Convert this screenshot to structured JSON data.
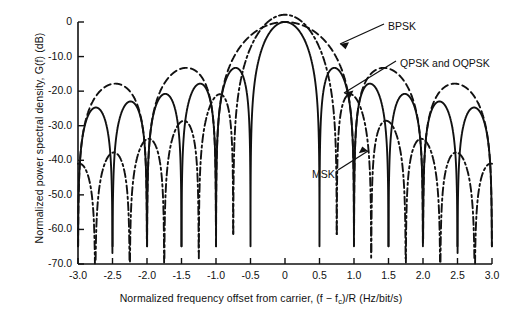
{
  "chart_data": {
    "type": "line",
    "title": "",
    "xlabel": "Normalized frequency offset from carrier, (f − f_c)/R (Hz/bit/s)",
    "xlabel_main": "Normalized frequency offset from carrier, (f − f",
    "xlabel_sub": "c",
    "xlabel_tail": ")/R (Hz/bit/s)",
    "ylabel": "Normalized power spectral density, G(f) (dB)",
    "xlim": [
      -3.0,
      3.0
    ],
    "ylim": [
      -70.0,
      0.0
    ],
    "grid": false,
    "legend_position": "inline-annotations",
    "xticks": [
      "-3.0",
      "-2.5",
      "-2.0",
      "-1.5",
      "-1.0",
      "-0.5",
      "0",
      "0.5",
      "1.0",
      "1.5",
      "2.0",
      "2.5",
      "3.0"
    ],
    "xtick_values": [
      -3.0,
      -2.5,
      -2.0,
      -1.5,
      -1.0,
      -0.5,
      0,
      0.5,
      1.0,
      1.5,
      2.0,
      2.5,
      3.0
    ],
    "yticks": [
      "0",
      "-10.0",
      "-20.0",
      "-30.0",
      "-40.0",
      "-50.0",
      "-60.0",
      "-70.0"
    ],
    "ytick_values": [
      0,
      -10,
      -20,
      -30,
      -40,
      -50,
      -60,
      -70
    ],
    "series": [
      {
        "name": "BPSK",
        "style": "dashed",
        "color": "#111111",
        "formula": "10*log10( sinc(f)^2 )",
        "first_null": 1.0,
        "sidelobe_peaks_db": [
          -13.3,
          -17.9,
          -20.8,
          -22.9,
          -24.6
        ],
        "sidelobe_peak_x": [
          1.43,
          2.46,
          3.47,
          4.48,
          5.49
        ]
      },
      {
        "name": "QPSK and OQPSK",
        "style": "solid",
        "color": "#111111",
        "formula": "10*log10( sinc(2f)^2 )",
        "first_null": 0.5,
        "sidelobe_peaks_db": [
          -13.3,
          -17.9,
          -20.8,
          -22.9,
          -24.6
        ],
        "sidelobe_peak_x": [
          0.715,
          1.23,
          1.735,
          2.24,
          2.745
        ]
      },
      {
        "name": "MSK",
        "style": "dash-dot",
        "color": "#111111",
        "formula": "10*log10( (16/pi^2) * (cos(2*pi*f)/(1-16*f^2))^2 )",
        "first_null": 0.75,
        "sidelobe_peaks_db": [
          -23.0,
          -27.8,
          -31.0,
          -33.3,
          -35.2
        ],
        "sidelobe_peak_x": [
          1.0,
          1.5,
          2.0,
          2.5,
          3.0
        ]
      }
    ],
    "annotations": [
      {
        "text": "BPSK",
        "x_px": 388,
        "y_px": 20,
        "arrow_to_x": 338,
        "arrow_to_y": 42
      },
      {
        "text": "QPSK and OQPSK",
        "x_px": 400,
        "y_px": 57,
        "arrow_to_x": 342,
        "arrow_to_y": 92
      },
      {
        "text": "MSK",
        "x_px": 312,
        "y_px": 168,
        "arrow_to_x": 366,
        "arrow_to_y": 150
      }
    ]
  },
  "axes": {
    "x_label_main": "Normalized frequency offset from carrier, (f − f",
    "x_label_sub": "c",
    "x_label_tail": ")/R (Hz/bit/s)",
    "y_label": "Normalized power spectral density, G(f) (dB)"
  }
}
